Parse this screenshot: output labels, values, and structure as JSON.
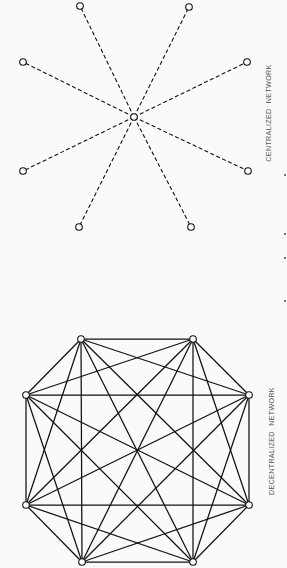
{
  "figure": {
    "diagrams": [
      {
        "id": "centralized",
        "caption": "CENTRALIZED NETWORK",
        "edge_style": "dashed",
        "hub": {
          "x": 134,
          "y": 117
        },
        "nodes": [
          {
            "x": 80,
            "y": 6
          },
          {
            "x": 189,
            "y": 7
          },
          {
            "x": 23,
            "y": 62
          },
          {
            "x": 247,
            "y": 62
          },
          {
            "x": 23,
            "y": 171
          },
          {
            "x": 248,
            "y": 171
          },
          {
            "x": 79,
            "y": 227
          },
          {
            "x": 191,
            "y": 227
          }
        ],
        "caption_position": {
          "x": 268,
          "y": 113
        }
      },
      {
        "id": "decentralized",
        "caption": "DECENTRALIZED NETWORK",
        "edge_style": "solid",
        "connectivity": "complete",
        "nodes": [
          {
            "x": 81,
            "y": 339
          },
          {
            "x": 193,
            "y": 339
          },
          {
            "x": 249,
            "y": 395
          },
          {
            "x": 249,
            "y": 505
          },
          {
            "x": 193,
            "y": 562
          },
          {
            "x": 82,
            "y": 562
          },
          {
            "x": 26,
            "y": 505
          },
          {
            "x": 26,
            "y": 395
          }
        ],
        "caption_position": {
          "x": 271,
          "y": 441
        }
      }
    ],
    "colors": {
      "background": "#fafafa",
      "line": "#111111",
      "node_fill": "#ffffff",
      "caption": "#555555"
    },
    "node_radius": 3.3,
    "edge_marks": [
      {
        "x": 284,
        "y": 174
      },
      {
        "x": 284,
        "y": 233
      },
      {
        "x": 284,
        "y": 257
      },
      {
        "x": 284,
        "y": 300
      }
    ]
  }
}
